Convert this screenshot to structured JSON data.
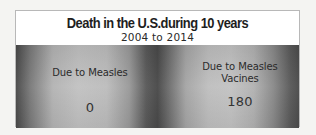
{
  "infographic": {
    "title": "Death in the U.S.during 10 years",
    "subtitle": "2004 to 2014",
    "stats": [
      {
        "label": "Due to Measles",
        "value": "0"
      },
      {
        "label": "Due to Measles\nVacines",
        "value": "180"
      }
    ]
  },
  "colors": {
    "title_box_bg": "#ffffff",
    "title_text": "#1e1e1e",
    "band_dark": "#4a4a4a",
    "band_light": "#c2c2c2",
    "stat_text": "#2b2b2b"
  }
}
